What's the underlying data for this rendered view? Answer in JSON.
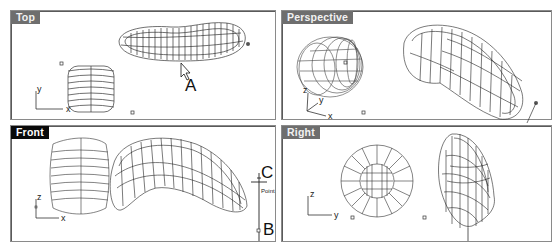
{
  "viewports": [
    {
      "name": "Top",
      "active": false
    },
    {
      "name": "Perspective",
      "active": false
    },
    {
      "name": "Front",
      "active": true
    },
    {
      "name": "Right",
      "active": false
    }
  ],
  "axes": {
    "top": {
      "a": "y",
      "b": "x"
    },
    "perspective": {
      "a": "z",
      "b": "y",
      "c": "x"
    },
    "front": {
      "a": "z",
      "b": "x"
    },
    "right": {
      "a": "z",
      "b": "y"
    }
  },
  "callouts": {
    "a": "A",
    "b": "B",
    "c": "C"
  },
  "snap_label": "Point",
  "colors": {
    "active_label_bg": "#0a0a0a",
    "inactive_label_bg": "#6e6e6e",
    "wire": "#222222",
    "border": "#8a8a8a"
  }
}
